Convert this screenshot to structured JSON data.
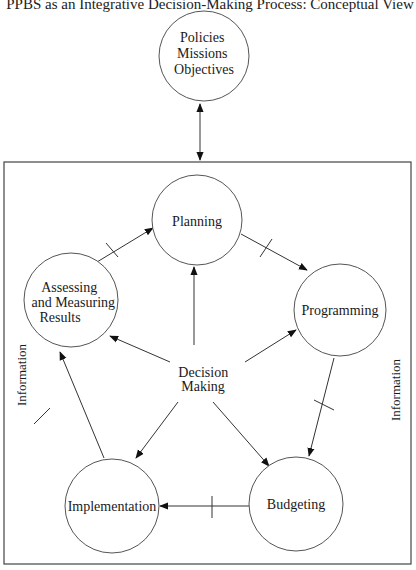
{
  "title": "PPBS as an Integrative Decision-Making Process: Conceptual View",
  "nodes": {
    "policies": {
      "lines": [
        "Policies",
        "Missions",
        "Objectives"
      ]
    },
    "planning": {
      "label": "Planning"
    },
    "programming": {
      "label": "Programming"
    },
    "budgeting": {
      "label": "Budgeting"
    },
    "implementation": {
      "label": "Implementation"
    },
    "assessing": {
      "lines": [
        "Assessing",
        "and Measuring",
        "Results"
      ]
    },
    "decision_making": {
      "lines": [
        "Decision",
        "Making"
      ]
    }
  },
  "side_labels": {
    "left": "Information",
    "right": "Information"
  },
  "footer": "Source: Based on the defense planning..."
}
